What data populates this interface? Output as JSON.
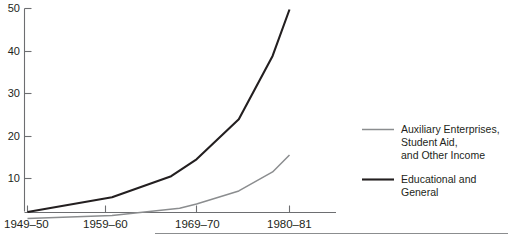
{
  "chart_data": {
    "type": "line",
    "title": "",
    "subtitle": "",
    "xlabel": "",
    "ylabel": "",
    "grid": false,
    "legend_position": "right",
    "x": [
      "1949-50",
      "1959-60",
      "1969-70",
      "1980-81"
    ],
    "xtick_labels": [
      "1949–50",
      "1959–60",
      "1969–70",
      "1980–81"
    ],
    "ytick_labels": [
      "10",
      "20",
      "30",
      "40",
      "50"
    ],
    "ytick_values": [
      10,
      20,
      30,
      40,
      50
    ],
    "ylim": [
      0,
      51
    ],
    "series": [
      {
        "name": "Educational and General",
        "color": "#231f20",
        "values": [
          2,
          5.5,
          14.5,
          50
        ],
        "points": [
          {
            "x": "1949-50",
            "y": 2
          },
          {
            "x": "1959-60",
            "y": 5.5
          },
          {
            "x": "1966-67",
            "y": 10.5
          },
          {
            "x": "1969-70",
            "y": 14.5
          },
          {
            "x": "1974-75",
            "y": 24
          },
          {
            "x": "1978-79",
            "y": 39
          },
          {
            "x": "1980-81",
            "y": 50
          }
        ]
      },
      {
        "name": "Auxiliary Enterprises, Student Aid, and Other Income",
        "color": "#8b8d8f",
        "values": [
          0.5,
          1.2,
          3.1,
          15.5
        ],
        "points": [
          {
            "x": "1949-50",
            "y": 0.5
          },
          {
            "x": "1959-60",
            "y": 1.2
          },
          {
            "x": "1967-68",
            "y": 2.9
          },
          {
            "x": "1969-70",
            "y": 3.9
          },
          {
            "x": "1974-75",
            "y": 7
          },
          {
            "x": "1978-79",
            "y": 11.5
          },
          {
            "x": "1980-81",
            "y": 15.5
          }
        ]
      }
    ]
  },
  "legend": {
    "entries": [
      {
        "swatch": "gray-line-swatch",
        "lines": [
          "Auxiliary Enterprises,",
          "Student Aid,",
          "and Other Income"
        ]
      },
      {
        "swatch": "dark-line-swatch",
        "lines": [
          "Educational and",
          "General"
        ]
      }
    ]
  },
  "colors": {
    "dark_series": "#231f20",
    "gray_series": "#8b8d8f",
    "axis": "#6d6e71",
    "rule": "#8b8d8f",
    "background": "#ffffff"
  }
}
